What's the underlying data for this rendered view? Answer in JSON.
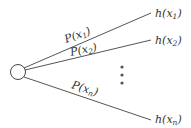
{
  "diagram": {
    "type": "lottery-tree",
    "root": {
      "shape": "circle",
      "stroke": "#444444",
      "fill": "#ffffff"
    },
    "branches": [
      {
        "prob_label": "P(x",
        "prob_sub": "1",
        "outcome_label": "h(x",
        "outcome_sub": "1"
      },
      {
        "prob_label": "P(x",
        "prob_sub": "2",
        "outcome_label": "h(x",
        "outcome_sub": "2"
      },
      {
        "prob_label": "P(x",
        "prob_sub": "n",
        "outcome_label": "h(x",
        "outcome_sub": "n"
      }
    ],
    "ellipsis": "vertical-dots",
    "line_color": "#555555",
    "text_color": "#333333"
  }
}
